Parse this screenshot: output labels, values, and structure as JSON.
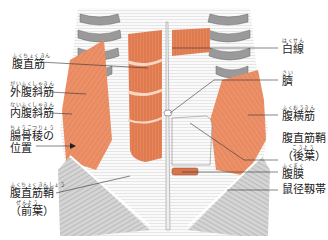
{
  "colors": {
    "muscle": "#e8845a",
    "muscle_light": "#f4b08c",
    "bone": "#8c8c8c",
    "sheath": "#ffffff",
    "line": "#333333"
  },
  "labels_left": [
    {
      "id": "rectus-abdominis",
      "ruby": "ふくちょくきん",
      "text": "腹直筋"
    },
    {
      "id": "external-oblique",
      "ruby": "がいふくしゃきん",
      "text": "外腹斜筋"
    },
    {
      "id": "internal-oblique",
      "ruby": "ないふくしゃきん",
      "text": "内腹斜筋"
    },
    {
      "id": "iliac-crest",
      "ruby": "ちょうこつりょう",
      "text": "腸骨稜の",
      "text2": "位置"
    },
    {
      "id": "rectus-sheath-anterior",
      "ruby": "ふくちょくきんしょう",
      "text": "腹直筋鞘",
      "ruby2": "ぜんよう",
      "text2": "（前葉）"
    }
  ],
  "labels_right": [
    {
      "id": "linea-alba",
      "ruby": "はくせん",
      "text": "白線"
    },
    {
      "id": "navel",
      "ruby": "さい",
      "text": "臍"
    },
    {
      "id": "transversus-abdominis",
      "ruby": "ふくおうきん",
      "text": "腹横筋"
    },
    {
      "id": "rectus-sheath-posterior",
      "ruby": "",
      "text": "腹直筋鞘",
      "ruby2": "こうよう",
      "text2": "（後葉）"
    },
    {
      "id": "peritoneum",
      "ruby": "ふくまく",
      "text": "腹膜"
    },
    {
      "id": "inguinal-ligament",
      "ruby": "",
      "text": "鼠径靱帯"
    }
  ]
}
